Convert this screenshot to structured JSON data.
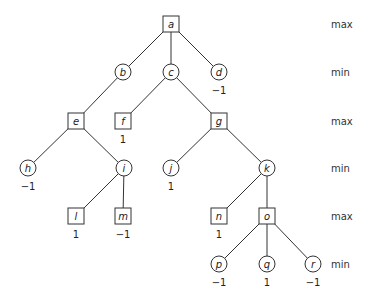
{
  "diagram": {
    "type": "game-tree",
    "nodes": [
      {
        "id": "a",
        "label": "a",
        "shape": "square",
        "x": 171,
        "y": 24,
        "value": null
      },
      {
        "id": "b",
        "label": "b",
        "shape": "circle",
        "x": 123,
        "y": 72,
        "value": null
      },
      {
        "id": "c",
        "label": "c",
        "shape": "circle",
        "x": 171,
        "y": 72,
        "value": null
      },
      {
        "id": "d",
        "label": "d",
        "shape": "circle",
        "x": 219,
        "y": 72,
        "value": "−1"
      },
      {
        "id": "e",
        "label": "e",
        "shape": "square",
        "x": 76,
        "y": 121,
        "value": null
      },
      {
        "id": "f",
        "label": "f",
        "shape": "square",
        "x": 123,
        "y": 121,
        "value": "1"
      },
      {
        "id": "g",
        "label": "g",
        "shape": "square",
        "x": 219,
        "y": 121,
        "value": null
      },
      {
        "id": "h",
        "label": "h",
        "shape": "circle",
        "x": 28,
        "y": 168,
        "value": "−1"
      },
      {
        "id": "i",
        "label": "i",
        "shape": "circle",
        "x": 124,
        "y": 168,
        "value": null
      },
      {
        "id": "j",
        "label": "j",
        "shape": "circle",
        "x": 171,
        "y": 168,
        "value": "1"
      },
      {
        "id": "k",
        "label": "k",
        "shape": "circle",
        "x": 267,
        "y": 168,
        "value": null
      },
      {
        "id": "l",
        "label": "l",
        "shape": "square",
        "x": 76,
        "y": 216,
        "value": "1"
      },
      {
        "id": "m",
        "label": "m",
        "shape": "square",
        "x": 123,
        "y": 216,
        "value": "−1"
      },
      {
        "id": "n",
        "label": "n",
        "shape": "square",
        "x": 219,
        "y": 216,
        "value": "1"
      },
      {
        "id": "o",
        "label": "o",
        "shape": "square",
        "x": 267,
        "y": 216,
        "value": null
      },
      {
        "id": "p",
        "label": "p",
        "shape": "circle",
        "x": 219,
        "y": 264,
        "value": "−1"
      },
      {
        "id": "q",
        "label": "q",
        "shape": "circle",
        "x": 267,
        "y": 264,
        "value": "1"
      },
      {
        "id": "r",
        "label": "r",
        "shape": "circle",
        "x": 313,
        "y": 264,
        "value": "−1"
      }
    ],
    "edges": [
      [
        "a",
        "b"
      ],
      [
        "a",
        "c"
      ],
      [
        "a",
        "d"
      ],
      [
        "b",
        "e"
      ],
      [
        "c",
        "f"
      ],
      [
        "c",
        "g"
      ],
      [
        "e",
        "h"
      ],
      [
        "e",
        "i"
      ],
      [
        "g",
        "j"
      ],
      [
        "g",
        "k"
      ],
      [
        "i",
        "l"
      ],
      [
        "i",
        "m"
      ],
      [
        "k",
        "n"
      ],
      [
        "k",
        "o"
      ],
      [
        "o",
        "p"
      ],
      [
        "o",
        "q"
      ],
      [
        "o",
        "r"
      ]
    ],
    "levels": [
      {
        "label": "max",
        "y": 24
      },
      {
        "label": "min",
        "y": 72
      },
      {
        "label": "max",
        "y": 121
      },
      {
        "label": "min",
        "y": 168
      },
      {
        "label": "max",
        "y": 216
      },
      {
        "label": "min",
        "y": 264
      }
    ],
    "level_label_x": 331
  }
}
